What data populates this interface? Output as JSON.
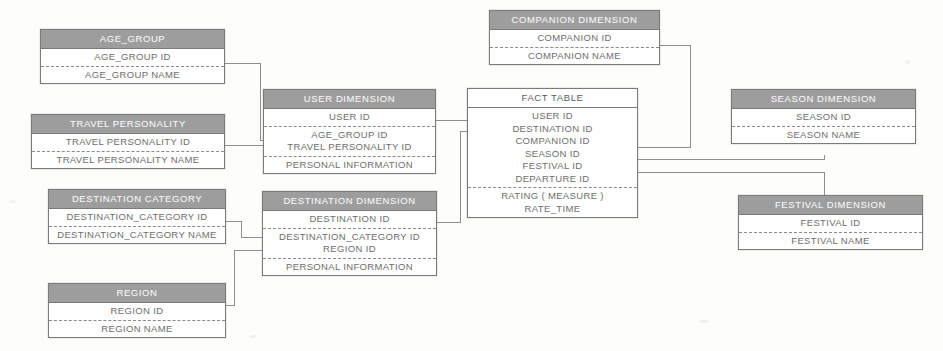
{
  "diagram": {
    "type": "star-schema",
    "colors": {
      "header_fill": "#9d9d9d",
      "header_text": "#f3f3f3",
      "body_fill": "#ffffff",
      "border": "#7b7b7b",
      "field_text": "#6e6e6e",
      "connector": "#8e8e8e",
      "background": "#fdfdfc"
    }
  },
  "entities": {
    "age_group": {
      "title": "AGE_GROUP",
      "fields": [
        "AGE_GROUP ID",
        "AGE_GROUP NAME"
      ]
    },
    "travel_personality": {
      "title": "TRAVEL PERSONALITY",
      "fields": [
        "TRAVEL PERSONALITY ID",
        "TRAVEL  PERSONALITY NAME"
      ]
    },
    "destination_category": {
      "title": "DESTINATION CATEGORY",
      "fields": [
        "DESTINATION_CATEGORY ID",
        "DESTINATION_CATEGORY NAME"
      ]
    },
    "region": {
      "title": "REGION",
      "fields": [
        "REGION ID",
        "REGION NAME"
      ]
    },
    "user_dimension": {
      "title": "USER DIMENSION",
      "key_field": "USER ID",
      "fk_fields": [
        "AGE_GROUP ID",
        "TRAVEL PERSONALITY ID"
      ],
      "attr_fields": [
        "PERSONAL INFORMATION"
      ]
    },
    "destination_dimension": {
      "title": "DESTINATION DIMENSION",
      "key_field": "DESTINATION ID",
      "fk_fields": [
        "DESTINATION_CATEGORY ID",
        "REGION ID"
      ],
      "attr_fields": [
        "PERSONAL INFORMATION"
      ]
    },
    "companion_dimension": {
      "title": "COMPANION  DIMENSION",
      "fields": [
        "COMPANION ID",
        "COMPANION NAME"
      ]
    },
    "season_dimension": {
      "title": "SEASON DIMENSION",
      "fields": [
        "SEASON ID",
        "SEASON NAME"
      ]
    },
    "festival_dimension": {
      "title": "FESTIVAL DIMENSION",
      "fields": [
        "FESTIVAL ID",
        "FESTIVAL NAME"
      ]
    },
    "fact_table": {
      "title": "FACT TABLE",
      "key_fields": [
        "USER ID",
        "DESTINATION ID",
        "COMPANION ID",
        "SEASON ID",
        "FESTIVAL ID",
        "DEPARTURE ID"
      ],
      "measure_fields": [
        "RATING ( MEASURE )",
        "RATE_TIME"
      ]
    }
  },
  "relationships": [
    {
      "from": "age_group",
      "to": "user_dimension",
      "via": "AGE_GROUP ID"
    },
    {
      "from": "travel_personality",
      "to": "user_dimension",
      "via": "TRAVEL PERSONALITY ID"
    },
    {
      "from": "destination_category",
      "to": "destination_dimension",
      "via": "DESTINATION_CATEGORY ID"
    },
    {
      "from": "region",
      "to": "destination_dimension",
      "via": "REGION ID"
    },
    {
      "from": "user_dimension",
      "to": "fact_table",
      "via": "USER ID"
    },
    {
      "from": "destination_dimension",
      "to": "fact_table",
      "via": "DESTINATION ID"
    },
    {
      "from": "companion_dimension",
      "to": "fact_table",
      "via": "COMPANION ID"
    },
    {
      "from": "season_dimension",
      "to": "fact_table",
      "via": "SEASON ID"
    },
    {
      "from": "festival_dimension",
      "to": "fact_table",
      "via": "FESTIVAL ID"
    }
  ]
}
